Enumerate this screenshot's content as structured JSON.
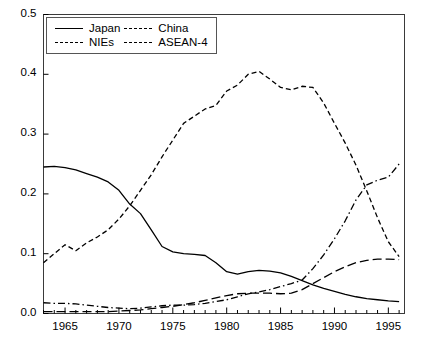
{
  "chart_data": {
    "type": "line",
    "title": "",
    "xlabel": "",
    "ylabel": "",
    "xlim": [
      1963,
      1996.5
    ],
    "ylim": [
      0.0,
      0.5
    ],
    "grid": false,
    "legend_position": "top-left",
    "y_ticks": [
      "0.0",
      "0.1",
      "0.2",
      "0.3",
      "0.4",
      "0.5"
    ],
    "y_tick_values": [
      0.0,
      0.1,
      0.2,
      0.3,
      0.4,
      0.5
    ],
    "x_ticks": [
      "1965",
      "1970",
      "1975",
      "1980",
      "1985",
      "1990",
      "1995"
    ],
    "x_tick_values": [
      1965,
      1970,
      1975,
      1980,
      1985,
      1990,
      1995
    ],
    "x_minor_step": 1,
    "x": [
      1963,
      1964,
      1965,
      1966,
      1967,
      1968,
      1969,
      1970,
      1971,
      1972,
      1973,
      1974,
      1975,
      1976,
      1977,
      1978,
      1979,
      1980,
      1981,
      1982,
      1983,
      1984,
      1985,
      1986,
      1987,
      1988,
      1989,
      1990,
      1991,
      1992,
      1993,
      1994,
      1995,
      1996
    ],
    "series": [
      {
        "name": "Japan",
        "style": "solid",
        "color": "#000000",
        "values": [
          0.245,
          0.246,
          0.244,
          0.24,
          0.234,
          0.228,
          0.22,
          0.206,
          0.183,
          0.167,
          0.14,
          0.112,
          0.103,
          0.1,
          0.099,
          0.097,
          0.085,
          0.07,
          0.066,
          0.07,
          0.072,
          0.071,
          0.068,
          0.062,
          0.055,
          0.048,
          0.042,
          0.037,
          0.032,
          0.028,
          0.025,
          0.023,
          0.021,
          0.02
        ]
      },
      {
        "name": "China",
        "style": "dash-dot",
        "color": "#000000",
        "values": [
          0.018,
          0.017,
          0.017,
          0.016,
          0.014,
          0.012,
          0.01,
          0.009,
          0.008,
          0.009,
          0.011,
          0.013,
          0.014,
          0.014,
          0.015,
          0.017,
          0.02,
          0.023,
          0.028,
          0.033,
          0.036,
          0.04,
          0.045,
          0.05,
          0.056,
          0.075,
          0.098,
          0.125,
          0.155,
          0.19,
          0.215,
          0.223,
          0.228,
          0.25
        ]
      },
      {
        "name": "NIEs",
        "style": "dash",
        "color": "#000000",
        "values": [
          0.085,
          0.1,
          0.115,
          0.105,
          0.118,
          0.128,
          0.14,
          0.158,
          0.18,
          0.206,
          0.232,
          0.262,
          0.29,
          0.318,
          0.33,
          0.342,
          0.348,
          0.372,
          0.382,
          0.4,
          0.405,
          0.392,
          0.378,
          0.374,
          0.38,
          0.378,
          0.352,
          0.318,
          0.285,
          0.248,
          0.205,
          0.16,
          0.12,
          0.095
        ]
      },
      {
        "name": "ASEAN-4",
        "style": "long-dash",
        "color": "#000000",
        "values": [
          0.003,
          0.003,
          0.003,
          0.003,
          0.003,
          0.003,
          0.003,
          0.004,
          0.005,
          0.006,
          0.008,
          0.01,
          0.012,
          0.015,
          0.018,
          0.022,
          0.026,
          0.03,
          0.033,
          0.034,
          0.034,
          0.034,
          0.033,
          0.034,
          0.04,
          0.05,
          0.06,
          0.07,
          0.078,
          0.085,
          0.089,
          0.091,
          0.091,
          0.09
        ]
      }
    ]
  },
  "legend": {
    "entries": [
      {
        "label": "Japan",
        "key": "solid-line-key"
      },
      {
        "label": "China",
        "key": "dash-dot-line-key"
      },
      {
        "label": "NIEs",
        "key": "dash-line-key"
      },
      {
        "label": "ASEAN-4",
        "key": "long-dash-line-key"
      }
    ]
  }
}
